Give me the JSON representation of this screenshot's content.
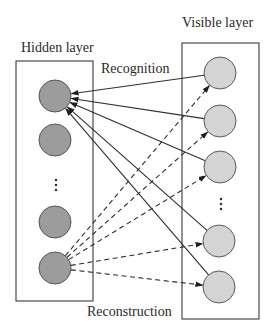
{
  "labels": {
    "hidden_layer": "Hidden layer",
    "visible_layer": "Visible layer",
    "recognition": "Recognition",
    "reconstruction": "Reconstruction"
  },
  "ellipsis": "⋮",
  "colors": {
    "hidden_node_fill": "#9c9c9c",
    "visible_node_fill": "#d4d4d4",
    "line": "#2e2e2e",
    "box": "#3a3a3a",
    "background": "#ffffff"
  },
  "hidden_layer": {
    "box": {
      "x": 16,
      "y": 61,
      "w": 77,
      "h": 240
    },
    "nodes": [
      {
        "id": "h1",
        "cx": 55,
        "cy": 96
      },
      {
        "id": "h2",
        "cx": 55,
        "cy": 140
      },
      {
        "id": "h3",
        "cx": 55,
        "cy": 222
      },
      {
        "id": "h4",
        "cx": 55,
        "cy": 268
      }
    ],
    "ellipsis_pos": {
      "x": 56,
      "y": 185
    }
  },
  "visible_layer": {
    "box": {
      "x": 182,
      "y": 43,
      "w": 77,
      "h": 276
    },
    "nodes": [
      {
        "id": "v1",
        "cx": 220,
        "cy": 73
      },
      {
        "id": "v2",
        "cx": 220,
        "cy": 121
      },
      {
        "id": "v3",
        "cx": 220,
        "cy": 167
      },
      {
        "id": "v4",
        "cx": 219,
        "cy": 241
      },
      {
        "id": "v5",
        "cx": 219,
        "cy": 287
      }
    ],
    "ellipsis_pos": {
      "x": 221,
      "y": 205
    }
  },
  "edges": {
    "recognition": {
      "style": "solid",
      "direction": "visible-to-hidden",
      "target": "h1",
      "sources": [
        "v1",
        "v2",
        "v3",
        "v4",
        "v5"
      ]
    },
    "reconstruction": {
      "style": "dashed",
      "direction": "hidden-to-visible",
      "source": "h4",
      "targets": [
        "v1",
        "v2",
        "v3",
        "v4",
        "v5"
      ]
    }
  },
  "node_radius": 16
}
